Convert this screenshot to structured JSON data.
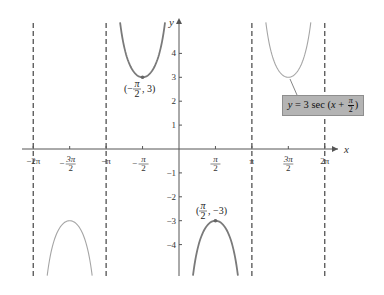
{
  "chart_data": {
    "type": "line",
    "title": "",
    "function": "y = 3 sec (x + π/2)",
    "xlabel": "x",
    "ylabel": "y",
    "xlim": [
      -6.6,
      7.0
    ],
    "ylim": [
      -5.3,
      5.3
    ],
    "x_ticks": [
      {
        "value": -6.2832,
        "label": "−2π"
      },
      {
        "value": -4.7124,
        "label": "−3π/2"
      },
      {
        "value": -3.1416,
        "label": "−π"
      },
      {
        "value": -1.5708,
        "label": "−π/2"
      },
      {
        "value": 1.5708,
        "label": "π/2"
      },
      {
        "value": 3.1416,
        "label": "π"
      },
      {
        "value": 4.7124,
        "label": "3π/2"
      },
      {
        "value": 6.2832,
        "label": "2π"
      }
    ],
    "y_ticks": [
      {
        "value": 4,
        "label": "4"
      },
      {
        "value": 3,
        "label": "3"
      },
      {
        "value": 2,
        "label": "2"
      },
      {
        "value": 1,
        "label": "1"
      },
      {
        "value": -1,
        "label": "−1"
      },
      {
        "value": -2,
        "label": "−2"
      },
      {
        "value": -3,
        "label": "−3"
      },
      {
        "value": -4,
        "label": "−4"
      }
    ],
    "asymptotes": [
      -6.2832,
      -3.1416,
      3.1416,
      6.2832
    ],
    "branches": [
      {
        "center": -4.7124,
        "extremum": -3,
        "direction": "down",
        "emphasis": false
      },
      {
        "center": -1.5708,
        "extremum": 3,
        "direction": "up",
        "emphasis": true
      },
      {
        "center": 1.5708,
        "extremum": -3,
        "direction": "down",
        "emphasis": true
      },
      {
        "center": 4.7124,
        "extremum": 3,
        "direction": "up",
        "emphasis": false
      }
    ],
    "annotations": [
      {
        "point": [
          -1.5708,
          3
        ],
        "label": "(−π/2, 3)"
      },
      {
        "point": [
          1.5708,
          -3
        ],
        "label": "(π/2, −3)"
      }
    ],
    "legend_box": "y = 3 sec (x + π/2)",
    "grid": false,
    "colors": {
      "axis": "#555555",
      "asymptote": "#444444",
      "curve_emphasis": "#7a7a7a",
      "curve_light": "#a5a5a5",
      "label_box_fill": "#b4b4b4"
    }
  },
  "labels": {
    "x_axis": "x",
    "y_axis": "y",
    "point_max": "(−π/2, 3)",
    "point_min": "(π/2, −3)",
    "equation": "y = 3 sec (x + π/2)"
  }
}
